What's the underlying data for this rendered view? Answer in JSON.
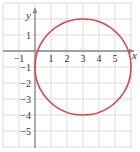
{
  "chart_data": {
    "type": "line",
    "title": "",
    "xlabel": "x",
    "ylabel": "y",
    "xlim": [
      -2,
      6.5
    ],
    "ylim": [
      -6,
      3
    ],
    "grid": true,
    "x_ticks": [
      -1,
      1,
      2,
      3,
      4,
      5
    ],
    "y_ticks": [
      1,
      -1,
      -2,
      -3,
      -4,
      -5
    ],
    "x_tick_labels": [
      "−1",
      "1",
      "2",
      "3",
      "4",
      "5"
    ],
    "y_tick_labels": [
      "1",
      "−1",
      "−2",
      "−3",
      "−4",
      "−5"
    ],
    "series": [
      {
        "name": "circle",
        "shape": "circle",
        "center": [
          3,
          -1
        ],
        "radius": 3,
        "color": "#d9444d"
      }
    ]
  },
  "colors": {
    "grid": "#dcdcdc",
    "axis": "#888888",
    "curve": "#d9444d"
  }
}
